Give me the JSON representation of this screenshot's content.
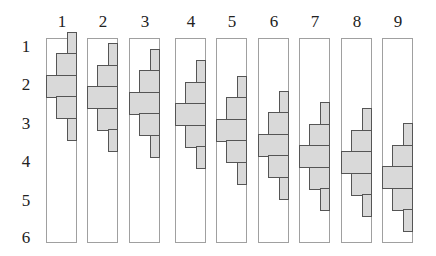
{
  "figure": {
    "column_labels": [
      "1",
      "2",
      "3",
      "4",
      "5",
      "6",
      "7",
      "8",
      "9"
    ],
    "row_labels": [
      "1",
      "2",
      "3",
      "4",
      "5",
      "6"
    ],
    "colors": {
      "bar_fill": "#d9d9d9",
      "bar_stroke": "#555555",
      "panel_border": "#a0a0a0"
    },
    "panels": [
      {
        "label": "1",
        "x": 46,
        "center": 2.0
      },
      {
        "label": "2",
        "x": 87,
        "center": 2.3
      },
      {
        "label": "3",
        "x": 129,
        "center": 2.45
      },
      {
        "label": "4",
        "x": 175,
        "center": 2.75
      },
      {
        "label": "5",
        "x": 216,
        "center": 3.15
      },
      {
        "label": "6",
        "x": 258,
        "center": 3.55
      },
      {
        "label": "7",
        "x": 299,
        "center": 3.85
      },
      {
        "label": "8",
        "x": 341,
        "center": 4.0
      },
      {
        "label": "9",
        "x": 382,
        "center": 4.4
      }
    ],
    "bar_widths_fraction": [
      0.33,
      0.67,
      1.0,
      0.67,
      0.33
    ]
  }
}
